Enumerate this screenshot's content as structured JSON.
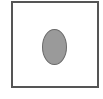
{
  "diagram": {
    "frame": {
      "shape": "square",
      "border_color": "#555555",
      "fill": "#ffffff"
    },
    "shape": {
      "type": "ellipse",
      "fill": "#9a9a9a",
      "stroke": "#6a6a6a"
    }
  }
}
